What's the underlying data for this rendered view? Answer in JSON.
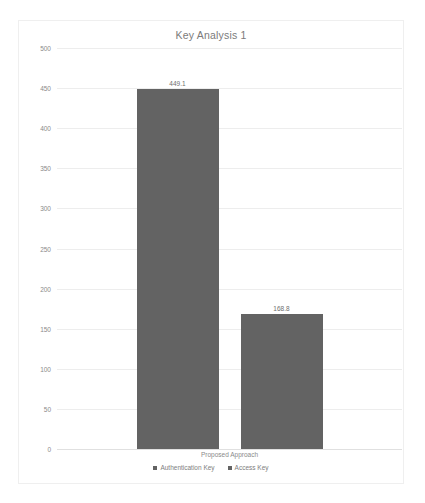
{
  "chart_data": {
    "type": "bar",
    "title": "Key Analysis 1",
    "categories": [
      "Proposed Approach"
    ],
    "xlabel": "",
    "ylabel": "",
    "ylim": [
      0,
      500
    ],
    "ytick_labels": [
      "500",
      "450",
      "400",
      "350",
      "300",
      "250",
      "200",
      "150",
      "100",
      "50",
      "0"
    ],
    "ytick_values": [
      500,
      450,
      400,
      350,
      300,
      250,
      200,
      150,
      100,
      50,
      0
    ],
    "grid": true,
    "legend_position": "bottom",
    "series": [
      {
        "name": "Authentication Key",
        "values": [
          449.1
        ],
        "data_labels": [
          "449.1"
        ],
        "color": "#636363"
      },
      {
        "name": "Access Key",
        "values": [
          168.8
        ],
        "data_labels": [
          "168.8"
        ],
        "color": "#636363"
      }
    ]
  },
  "colors": {
    "bar": "#636363",
    "gridline": "#ededed",
    "frame_border": "#efefef",
    "title_text": "#7b7b7b",
    "tick_text": "#8a8a8a",
    "background": "#ffffff"
  }
}
